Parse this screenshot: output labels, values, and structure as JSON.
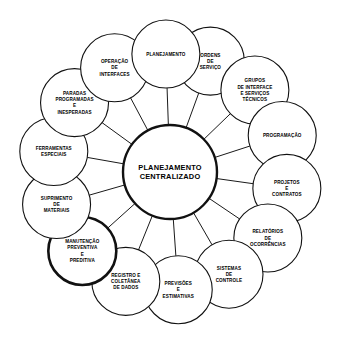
{
  "diagram": {
    "type": "radial-hub-and-spoke",
    "center": {
      "name": "center-node",
      "lines": [
        "PLANEJAMENTO",
        "CENTRALIZADO"
      ],
      "emphasis": true
    },
    "nodes": [
      {
        "id": "ordens-de-servico",
        "lines": [
          "ORDENS",
          "DE",
          "SERVIÇO"
        ],
        "angle": -70,
        "emphasis": false
      },
      {
        "id": "grupos-de-interface-e-servicos-tecnicos",
        "lines": [
          "GRUPOS",
          "DE INTERFACE",
          "E SERVIÇOS",
          "TÉCNICOS"
        ],
        "angle": -44,
        "emphasis": false
      },
      {
        "id": "programacao",
        "lines": [
          "PROGRAMAÇÃO"
        ],
        "angle": -18,
        "emphasis": false
      },
      {
        "id": "projetos-e-contratos",
        "lines": [
          "PROJETOS",
          "E",
          "CONTRATOS"
        ],
        "angle": 8,
        "emphasis": false
      },
      {
        "id": "relatorios-de-ocorrencias",
        "lines": [
          "RELATÓRIOS",
          "DE",
          "OCORRÊNCIAS"
        ],
        "angle": 34,
        "emphasis": false
      },
      {
        "id": "sistemas-de-controle",
        "lines": [
          "SISTEMAS",
          "DE",
          "CONTROLE"
        ],
        "angle": 60,
        "emphasis": false
      },
      {
        "id": "previsoes-e-estimativas",
        "lines": [
          "PREVISÕES",
          "E",
          "ESTIMATIVAS"
        ],
        "angle": 86,
        "emphasis": false
      },
      {
        "id": "registro-e-coletanea-de-dados",
        "lines": [
          "REGISTRO E",
          "COLETÂNEA",
          "DE DADOS"
        ],
        "angle": 112,
        "emphasis": false
      },
      {
        "id": "manutencao-preventiva-e-preditiva",
        "lines": [
          "MANUTENÇÃO",
          "PREVENTIVA",
          "E",
          "PREDITIVA"
        ],
        "angle": 138,
        "emphasis": true
      },
      {
        "id": "suprimento-de-materiais",
        "lines": [
          "SUPRIMENTO",
          "DE",
          "MATERIAIS"
        ],
        "angle": 164,
        "emphasis": false
      },
      {
        "id": "ferramentas-especiais",
        "lines": [
          "FERRAMENTAS",
          "ESPECIAIS"
        ],
        "angle": 190,
        "emphasis": false
      },
      {
        "id": "paradas-programadas-e-inesperadas",
        "lines": [
          "PARADAS",
          "PROGRAMADAS",
          "E",
          "INESPERADAS"
        ],
        "angle": 216,
        "emphasis": false
      },
      {
        "id": "operacao-de-interfaces",
        "lines": [
          "OPERAÇÃO",
          "DE",
          "INTERFACES"
        ],
        "angle": 242,
        "emphasis": false
      },
      {
        "id": "planejamento",
        "lines": [
          "PLANEJAMENTO"
        ],
        "angle": 268,
        "emphasis": false
      }
    ],
    "colors": {
      "stroke": "#111111",
      "background": "#ffffff",
      "text": "#000000"
    },
    "geometry": {
      "center_x": 170,
      "center_y": 172,
      "center_radius": 47,
      "ring_radius": 118,
      "node_radius": 34
    }
  }
}
